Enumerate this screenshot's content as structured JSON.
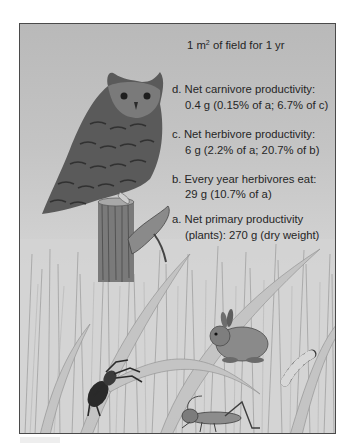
{
  "figure": {
    "header": {
      "prefix": "1 m",
      "superscript": "2",
      "suffix": " of field for 1 yr"
    },
    "levels": [
      {
        "id": "d",
        "label_line1": "d. Net carnivore productivity:",
        "label_line2": "0.4 g (0.15% of a; 6.7% of c)"
      },
      {
        "id": "c",
        "label_line1": "c. Net herbivore productivity:",
        "label_line2": "6 g (2.2% of a; 20.7% of b)"
      },
      {
        "id": "b",
        "label_line1": "b. Every year herbivores eat:",
        "label_line2": "29 g (10.7% of a)"
      },
      {
        "id": "a",
        "label_line1": "a. Net primary productivity",
        "label_line2": "(plants): 270 g (dry weight)"
      }
    ],
    "illustration": {
      "organisms": [
        "owl",
        "fence-post",
        "grass",
        "rabbit",
        "caterpillar",
        "spider",
        "grasshopper"
      ]
    },
    "colors": {
      "text": "#262626",
      "frame_border": "#4a4a4a",
      "sky_top": "#b9b9b9",
      "sky_bottom": "#dcdcdc"
    }
  }
}
